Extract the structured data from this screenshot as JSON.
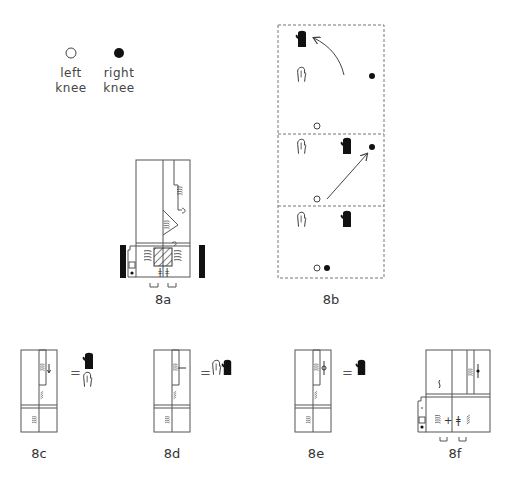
{
  "legend": {
    "left_knee": {
      "symbol": "open-circle",
      "line1": "left",
      "line2": "knee"
    },
    "right_knee": {
      "symbol": "filled-circle",
      "line1": "right",
      "line2": "knee"
    }
  },
  "figures": {
    "fig_8a": {
      "label": "8a"
    },
    "fig_8b": {
      "label": "8b",
      "panels": 3
    },
    "fig_8c": {
      "label": "8c",
      "equals": "="
    },
    "fig_8d": {
      "label": "8d",
      "equals": "="
    },
    "fig_8e": {
      "label": "8e",
      "equals": "="
    },
    "fig_8f": {
      "label": "8f"
    }
  },
  "colors": {
    "ink": "#222222",
    "stroke": "#555555",
    "dash": "#777777"
  }
}
